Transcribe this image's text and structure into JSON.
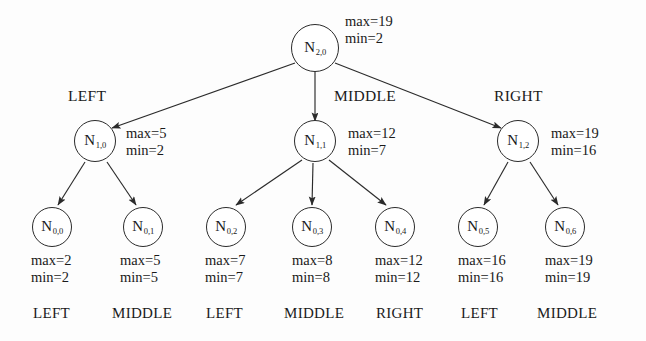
{
  "diagram": {
    "stroke_color": "#2b2b2b",
    "background_color": "#fdfdfd"
  },
  "root": {
    "id": "N2,0",
    "label_main": "N",
    "label_sub": "2,0",
    "max": "max=19",
    "min": "min=2",
    "cx": 315,
    "cy": 48
  },
  "level1": [
    {
      "id": "N1,0",
      "label_main": "N",
      "label_sub": "1,0",
      "max": "max=5",
      "min": "min=2",
      "edge_label": "LEFT",
      "cx": 95,
      "cy": 141,
      "edge_label_x": 68,
      "edge_label_y": 88,
      "stats_x": 126,
      "stats_y": 125
    },
    {
      "id": "N1,1",
      "label_main": "N",
      "label_sub": "1,1",
      "max": "max=12",
      "min": "min=7",
      "edge_label": "MIDDLE",
      "cx": 315,
      "cy": 141,
      "edge_label_x": 334,
      "edge_label_y": 88,
      "stats_x": 348,
      "stats_y": 125
    },
    {
      "id": "N1,2",
      "label_main": "N",
      "label_sub": "1,2",
      "max": "max=19",
      "min": "min=16",
      "edge_label": "RIGHT",
      "cx": 518,
      "cy": 141,
      "edge_label_x": 494,
      "edge_label_y": 88,
      "stats_x": 551,
      "stats_y": 125
    }
  ],
  "leaves": [
    {
      "id": "N0,0",
      "label_main": "N",
      "label_sub": "0,0",
      "max": "max=2",
      "min": "min=2",
      "bottom_label": "LEFT",
      "parent": "N1,0",
      "cx": 52,
      "cy": 227,
      "stats_x": 31,
      "stats_y": 252,
      "bottom_label_x": 33,
      "bottom_label_y": 306
    },
    {
      "id": "N0,1",
      "label_main": "N",
      "label_sub": "0,1",
      "max": "max=5",
      "min": "min=5",
      "bottom_label": "MIDDLE",
      "parent": "N1,0",
      "cx": 143,
      "cy": 227,
      "stats_x": 120,
      "stats_y": 252,
      "bottom_label_x": 112,
      "bottom_label_y": 306
    },
    {
      "id": "N0,2",
      "label_main": "N",
      "label_sub": "0,2",
      "max": "max=7",
      "min": "min=7",
      "bottom_label": "LEFT",
      "parent": "N1,1",
      "cx": 226,
      "cy": 227,
      "stats_x": 205,
      "stats_y": 252,
      "bottom_label_x": 206,
      "bottom_label_y": 306
    },
    {
      "id": "N0,3",
      "label_main": "N",
      "label_sub": "0,3",
      "max": "max=8",
      "min": "min=8",
      "bottom_label": "MIDDLE",
      "parent": "N1,1",
      "cx": 312,
      "cy": 227,
      "stats_x": 292,
      "stats_y": 252,
      "bottom_label_x": 284,
      "bottom_label_y": 306
    },
    {
      "id": "N0,4",
      "label_main": "N",
      "label_sub": "0,4",
      "max": "max=12",
      "min": "min=12",
      "bottom_label": "RIGHT",
      "parent": "N1,1",
      "cx": 395,
      "cy": 227,
      "stats_x": 375,
      "stats_y": 252,
      "bottom_label_x": 376,
      "bottom_label_y": 306
    },
    {
      "id": "N0,5",
      "label_main": "N",
      "label_sub": "0,5",
      "max": "max=16",
      "min": "min=16",
      "bottom_label": "LEFT",
      "parent": "N1,2",
      "cx": 478,
      "cy": 227,
      "stats_x": 458,
      "stats_y": 252,
      "bottom_label_x": 461,
      "bottom_label_y": 306
    },
    {
      "id": "N0,6",
      "label_main": "N",
      "label_sub": "0,6",
      "max": "max=19",
      "min": "min=19",
      "bottom_label": "MIDDLE",
      "parent": "N1,2",
      "cx": 565,
      "cy": 227,
      "stats_x": 545,
      "stats_y": 252,
      "bottom_label_x": 537,
      "bottom_label_y": 306
    }
  ]
}
